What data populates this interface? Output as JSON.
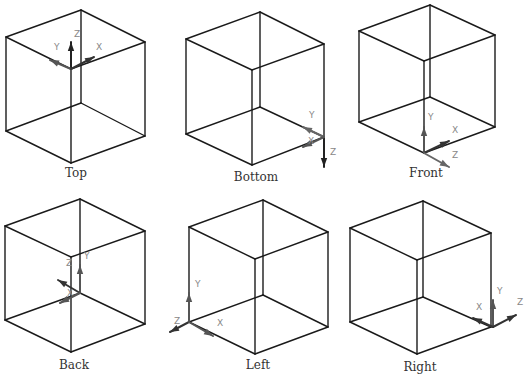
{
  "colors": {
    "edge": "#1a1a1a",
    "axis_dark": "#222222",
    "axis_gray": "#555555",
    "label": "#888888",
    "caption": "#333333"
  },
  "views": [
    {
      "name": "Top",
      "caption": "Top",
      "caption_pos": [
        76,
        178
      ],
      "cube": {
        "top": [
          81,
          10
        ],
        "left": [
          6,
          37
        ],
        "right": [
          145,
          42
        ],
        "front_top": [
          71,
          69
        ],
        "front_bottom": [
          71,
          163
        ],
        "back_bottom": [
          81,
          103
        ],
        "bottom_left": [
          6,
          131
        ],
        "bottom_right": [
          145,
          136
        ]
      },
      "triad": {
        "origin": [
          71,
          69
        ],
        "axes": [
          {
            "label": "Z",
            "end": [
              71,
              42
            ],
            "label_pos": [
              74,
              37
            ],
            "color": "#222222"
          },
          {
            "label": "Y",
            "end": [
              50,
              60
            ],
            "label_pos": [
              54,
              50
            ],
            "color": "#555555"
          },
          {
            "label": "X",
            "end": [
              94,
              57
            ],
            "label_pos": [
              96,
              50
            ],
            "color": "#333333"
          }
        ]
      }
    },
    {
      "name": "Bottom",
      "caption": "Bottom",
      "caption_pos": [
        256,
        182
      ],
      "cube": {
        "top": [
          260,
          12
        ],
        "left": [
          186,
          39
        ],
        "right": [
          324,
          44
        ],
        "front_top": [
          252,
          70
        ],
        "front_bottom": [
          252,
          165
        ],
        "back_bottom": [
          260,
          107
        ],
        "bottom_left": [
          186,
          134
        ],
        "bottom_right": [
          324,
          137
        ]
      },
      "triad": {
        "origin": [
          324,
          137
        ],
        "axes": [
          {
            "label": "Z",
            "end": [
              324,
              167
            ],
            "label_pos": [
              330,
              155
            ],
            "color": "#222222"
          },
          {
            "label": "Y",
            "end": [
              303,
              127
            ],
            "label_pos": [
              309,
              118
            ],
            "color": "#666666"
          },
          {
            "label": "X",
            "end": [
              303,
              147
            ],
            "label_pos": [
              308,
              144
            ],
            "color": "#555555"
          }
        ]
      }
    },
    {
      "name": "Front",
      "caption": "Front",
      "caption_pos": [
        426,
        178
      ],
      "cube": {
        "top": [
          430,
          5
        ],
        "left": [
          359,
          31
        ],
        "right": [
          495,
          35
        ],
        "front_top": [
          424,
          61
        ],
        "front_bottom": [
          424,
          153
        ],
        "back_bottom": [
          430,
          97
        ],
        "bottom_left": [
          359,
          122
        ],
        "bottom_right": [
          495,
          127
        ]
      },
      "triad": {
        "origin": [
          424,
          153
        ],
        "axes": [
          {
            "label": "Y",
            "end": [
              424,
              127
            ],
            "label_pos": [
              428,
              120
            ],
            "color": "#555555"
          },
          {
            "label": "X",
            "end": [
              449,
              141
            ],
            "label_pos": [
              452,
              133
            ],
            "color": "#333333"
          },
          {
            "label": "Z",
            "end": [
              449,
              167
            ],
            "label_pos": [
              452,
              158
            ],
            "color": "#666666"
          }
        ]
      }
    },
    {
      "name": "Back",
      "caption": "Back",
      "caption_pos": [
        74,
        370
      ],
      "cube": {
        "top": [
          80,
          199
        ],
        "left": [
          5,
          226
        ],
        "right": [
          145,
          231
        ],
        "front_top": [
          71,
          257
        ],
        "front_bottom": [
          71,
          352
        ],
        "back_bottom": [
          80,
          293
        ],
        "bottom_left": [
          5,
          320
        ],
        "bottom_right": [
          145,
          324
        ]
      },
      "triad": {
        "origin": [
          80,
          293
        ],
        "axes": [
          {
            "label": "Y",
            "end": [
              80,
              265
            ],
            "label_pos": [
              84,
              259
            ],
            "color": "#555555"
          },
          {
            "label": "Z",
            "end": [
              58,
              280
            ],
            "label_pos": [
              66,
              266
            ],
            "color": "#333333"
          },
          {
            "label": "X",
            "end": [
              60,
              303
            ],
            "label_pos": [
              67,
              296
            ],
            "color": "#555555"
          }
        ]
      }
    },
    {
      "name": "Left",
      "caption": "Left",
      "caption_pos": [
        258,
        370
      ],
      "cube": {
        "top": [
          263,
          200
        ],
        "left": [
          189,
          227
        ],
        "right": [
          328,
          232
        ],
        "front_top": [
          255,
          259
        ],
        "front_bottom": [
          255,
          354
        ],
        "back_bottom": [
          263,
          295
        ],
        "bottom_left": [
          189,
          322
        ],
        "bottom_right": [
          328,
          327
        ]
      },
      "triad": {
        "origin": [
          189,
          322
        ],
        "axes": [
          {
            "label": "Y",
            "end": [
              189,
              293
            ],
            "label_pos": [
              195,
              287
            ],
            "color": "#555555"
          },
          {
            "label": "Z",
            "end": [
              170,
              332
            ],
            "label_pos": [
              174,
              324
            ],
            "color": "#333333"
          },
          {
            "label": "X",
            "end": [
              213,
              336
            ],
            "label_pos": [
              217,
              326
            ],
            "color": "#555555"
          }
        ]
      }
    },
    {
      "name": "Right",
      "caption": "Right",
      "caption_pos": [
        420,
        372
      ],
      "cube": {
        "top": [
          423,
          201
        ],
        "left": [
          350,
          228
        ],
        "right": [
          491,
          233
        ],
        "front_top": [
          417,
          260
        ],
        "front_bottom": [
          417,
          354
        ],
        "back_bottom": [
          423,
          297
        ],
        "bottom_left": [
          350,
          322
        ],
        "bottom_right": [
          491,
          327
        ]
      },
      "triad": {
        "origin": [
          493,
          327
        ],
        "axes": [
          {
            "label": "Y",
            "end": [
              493,
              300
            ],
            "label_pos": [
              497,
              294
            ],
            "color": "#555555"
          },
          {
            "label": "X",
            "end": [
              473,
              318
            ],
            "label_pos": [
              476,
              310
            ],
            "color": "#333333"
          },
          {
            "label": "Z",
            "end": [
              516,
              315
            ],
            "label_pos": [
              517,
              305
            ],
            "color": "#333333"
          }
        ]
      }
    }
  ]
}
